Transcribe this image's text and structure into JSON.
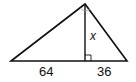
{
  "diagram": {
    "type": "right-triangle-altitude",
    "labels": {
      "left_segment": "64",
      "right_segment": "36",
      "altitude": "x"
    },
    "colors": {
      "stroke": "#111111",
      "angle_mark": "#999999",
      "background": "#ffffff"
    }
  }
}
